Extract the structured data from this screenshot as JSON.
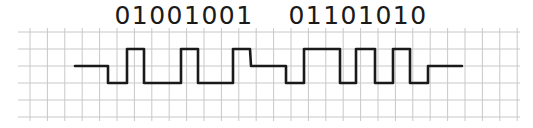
{
  "diagram": {
    "type": "digital-signal-waveform",
    "bytes": [
      {
        "label": "01001001",
        "bits": [
          0,
          1,
          0,
          0,
          1,
          0,
          0,
          1
        ]
      },
      {
        "label": "01101010",
        "bits": [
          0,
          1,
          1,
          0,
          1,
          0,
          1,
          0
        ]
      }
    ],
    "grid": {
      "x_start": 30,
      "x_step": 17.4,
      "x_count": 29,
      "y_lines": [
        32,
        49,
        66,
        83,
        100,
        117
      ],
      "color": "#c8c8c8"
    },
    "waveform": {
      "color": "#1a1a1a",
      "stroke_width": 2.6,
      "levels": {
        "high": 49,
        "idle": 66,
        "low": 83
      },
      "points": [
        [
          75,
          66
        ],
        [
          108,
          66
        ],
        [
          108,
          83
        ],
        [
          127,
          83
        ],
        [
          127,
          49
        ],
        [
          144,
          49
        ],
        [
          144,
          83
        ],
        [
          181,
          83
        ],
        [
          181,
          49
        ],
        [
          198,
          49
        ],
        [
          198,
          83
        ],
        [
          233,
          83
        ],
        [
          233,
          49
        ],
        [
          250,
          49
        ],
        [
          251,
          66
        ],
        [
          286,
          66
        ],
        [
          286,
          83
        ],
        [
          304,
          83
        ],
        [
          304,
          49
        ],
        [
          340,
          49
        ],
        [
          340,
          83
        ],
        [
          356,
          83
        ],
        [
          356,
          49
        ],
        [
          375,
          49
        ],
        [
          375,
          83
        ],
        [
          393,
          83
        ],
        [
          393,
          49
        ],
        [
          410,
          49
        ],
        [
          410,
          83
        ],
        [
          428,
          83
        ],
        [
          428,
          66
        ],
        [
          462,
          66
        ]
      ]
    }
  }
}
